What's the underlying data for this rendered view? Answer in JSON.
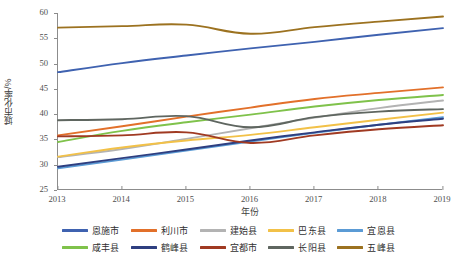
{
  "chart_data": {
    "type": "line",
    "title": "",
    "xlabel": "年份",
    "ylabel": "城市化率/%",
    "x": [
      2013,
      2014,
      2015,
      2016,
      2017,
      2018,
      2019
    ],
    "xlim": [
      2013,
      2019
    ],
    "ylim": [
      25,
      60
    ],
    "yticks": [
      25,
      30,
      35,
      40,
      45,
      50,
      55,
      60
    ],
    "grid": false,
    "legend_position": "bottom",
    "series": [
      {
        "name": "恩施市",
        "color": "#3f62b0",
        "values": [
          48.3,
          50.1,
          51.6,
          53.0,
          54.3,
          55.7,
          57.0
        ]
      },
      {
        "name": "利川市",
        "color": "#e2702a",
        "values": [
          35.8,
          37.6,
          39.5,
          41.3,
          43.0,
          44.2,
          45.3
        ]
      },
      {
        "name": "建始县",
        "color": "#b3b3b3",
        "values": [
          31.5,
          33.1,
          35.1,
          37.2,
          39.3,
          41.2,
          42.7
        ]
      },
      {
        "name": "巴东县",
        "color": "#f2c148",
        "values": [
          31.6,
          33.4,
          34.8,
          35.9,
          37.4,
          38.9,
          40.3
        ]
      },
      {
        "name": "宜恩县",
        "color": "#5b9bd5",
        "values": [
          29.3,
          31.0,
          32.8,
          34.6,
          36.3,
          37.9,
          39.4
        ]
      },
      {
        "name": "咸丰县",
        "color": "#7fc24b",
        "values": [
          34.5,
          36.7,
          38.4,
          39.9,
          41.5,
          42.8,
          43.8
        ]
      },
      {
        "name": "鹤峰县",
        "color": "#2e3f80",
        "values": [
          29.6,
          31.3,
          33.0,
          34.8,
          36.4,
          37.9,
          39.1
        ]
      },
      {
        "name": "宜都市",
        "color": "#a03a22",
        "values": [
          35.6,
          35.8,
          36.4,
          34.3,
          35.8,
          37.0,
          37.8
        ]
      },
      {
        "name": "长阳县",
        "color": "#5f6660",
        "values": [
          38.8,
          39.0,
          39.6,
          37.4,
          39.4,
          40.5,
          41.0
        ]
      },
      {
        "name": "五峰县",
        "color": "#9c7220",
        "values": [
          57.1,
          57.4,
          57.7,
          55.9,
          57.2,
          58.3,
          59.3
        ]
      }
    ]
  },
  "axes": {
    "y_tick_labels": [
      "60",
      "55",
      "50",
      "45",
      "40",
      "35",
      "30",
      "25"
    ],
    "x_tick_labels": [
      "2013",
      "2014",
      "2015",
      "2016",
      "2017",
      "2018",
      "2019"
    ],
    "x_title": "年份",
    "y_title": "城市化率/%"
  },
  "legend": {
    "rows": [
      [
        {
          "label": "恩施市",
          "color": "#3f62b0"
        },
        {
          "label": "利川市",
          "color": "#e2702a"
        },
        {
          "label": "建始县",
          "color": "#b3b3b3"
        },
        {
          "label": "巴东县",
          "color": "#f2c148"
        },
        {
          "label": "宜恩县",
          "color": "#5b9bd5"
        }
      ],
      [
        {
          "label": "咸丰县",
          "color": "#7fc24b"
        },
        {
          "label": "鹤峰县",
          "color": "#2e3f80"
        },
        {
          "label": "宜都市",
          "color": "#a03a22"
        },
        {
          "label": "长阳县",
          "color": "#5f6660"
        },
        {
          "label": "五峰县",
          "color": "#9c7220"
        }
      ]
    ]
  }
}
